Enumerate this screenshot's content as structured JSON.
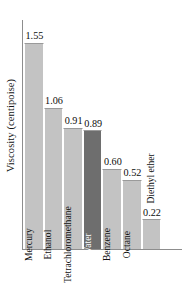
{
  "chart_data": {
    "type": "bar",
    "title": "",
    "xlabel": "",
    "ylabel": "Viscosity (centipoise)",
    "ylim": [
      0,
      1.72
    ],
    "grid": false,
    "legend": null,
    "categories": [
      "Mercury",
      "Ethanol",
      "Tetrachloromethane",
      "Water",
      "Benzene",
      "Octane",
      "Diethyl ether"
    ],
    "values": [
      1.55,
      1.06,
      0.91,
      0.89,
      0.6,
      0.52,
      0.22
    ],
    "value_labels": [
      "1.55",
      "1.06",
      "0.91",
      "0.89",
      "0.60",
      "0.52",
      "0.22"
    ],
    "highlight_index": 3,
    "colors": {
      "bar": "#c3c3c3",
      "bar_highlight": "#6e6e6e",
      "axis": "#8d8d8d",
      "text": "#111111",
      "highlight_text": "#ffffff",
      "background": "#ffffff"
    },
    "label_placement": [
      "inside",
      "inside",
      "inside",
      "inside",
      "inside",
      "inside",
      "outside"
    ]
  }
}
